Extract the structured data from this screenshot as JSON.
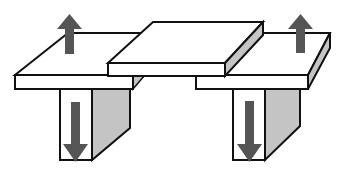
{
  "diagram": {
    "colors": {
      "face": "#ffffff",
      "shade": "#c4c4c4",
      "outline": "#111111",
      "arrow": "#555555"
    },
    "arrows": [
      {
        "id": "left-plate-up",
        "direction": "up"
      },
      {
        "id": "right-plate-up",
        "direction": "up"
      },
      {
        "id": "left-leg-down",
        "direction": "down"
      },
      {
        "id": "right-leg-down",
        "direction": "down"
      }
    ],
    "parts": [
      "left-plate",
      "center-plate",
      "right-plate",
      "left-leg",
      "right-leg"
    ]
  }
}
